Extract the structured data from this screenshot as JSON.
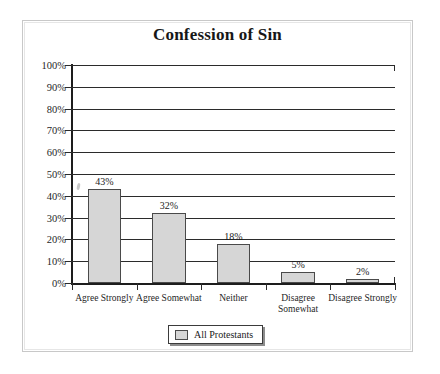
{
  "chart_data": {
    "type": "bar",
    "title": "Confession of Sin",
    "xlabel": "",
    "ylabel": "",
    "categories": [
      "Agree Strongly",
      "Agree Somewhat",
      "Neither",
      "Disagree Somewhat",
      "Disagree Strongly"
    ],
    "category_lines": [
      [
        "Agree Strongly"
      ],
      [
        "Agree Somewhat"
      ],
      [
        "Neither"
      ],
      [
        "Disagree",
        "Somewhat"
      ],
      [
        "Disagree Strongly"
      ]
    ],
    "values": [
      43,
      32,
      18,
      5,
      2
    ],
    "value_labels": [
      "43%",
      "32%",
      "18%",
      "5%",
      "2%"
    ],
    "series": [
      {
        "name": "All Protestants",
        "values": [
          43,
          32,
          18,
          5,
          2
        ]
      }
    ],
    "ylim": [
      0,
      100
    ],
    "ytick_values": [
      0,
      10,
      20,
      30,
      40,
      50,
      60,
      70,
      80,
      90,
      100
    ],
    "ytick_labels": [
      "0%",
      "10%",
      "20%",
      "30%",
      "40%",
      "50%",
      "60%",
      "70%",
      "80%",
      "90%",
      "100%"
    ],
    "grid": true,
    "legend_position": "bottom-center",
    "colors": {
      "bar_fill": "#d6d6d6",
      "bar_border": "#4a4a4a",
      "gridline": "#2b2b2b",
      "axis": "#1d1d1d",
      "text": "#1b1b1b",
      "frame": "#c8c8c8",
      "background": "#ffffff"
    }
  },
  "legend": {
    "items": [
      {
        "label": "All Protestants",
        "swatch_color": "#d6d6d6"
      }
    ]
  }
}
